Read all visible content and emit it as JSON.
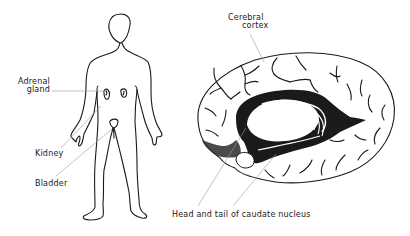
{
  "figure": {
    "left_panel": {
      "subject": "human body outline",
      "labels": {
        "adrenal_gland_line1": "Adrenal",
        "adrenal_gland_line2": "gland",
        "kidney": "Kidney",
        "bladder": "Bladder"
      }
    },
    "right_panel": {
      "subject": "medial view of brain hemisphere",
      "labels": {
        "cerebral_cortex_line1": "Cerebral",
        "cerebral_cortex_line2": "cortex",
        "caudate": "Head and tail of caudate nucleus"
      }
    }
  },
  "colors": {
    "ink": "#1a1a1a",
    "leader": "#9a9a9a",
    "background": "#ffffff"
  }
}
